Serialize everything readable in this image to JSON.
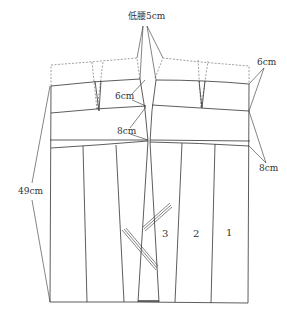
{
  "diagram": {
    "type": "sewing-pattern",
    "colors": {
      "line": "#333333",
      "dashed": "#888888",
      "background": "#ffffff"
    },
    "labels": {
      "low_waist": "低腰5cm",
      "right_top": "6cm",
      "center_upper": "6cm",
      "center_lower": "8cm",
      "right_lower": "8cm",
      "length": "49cm"
    },
    "panel_numbers": [
      "3",
      "2",
      "1"
    ],
    "caption": ""
  }
}
